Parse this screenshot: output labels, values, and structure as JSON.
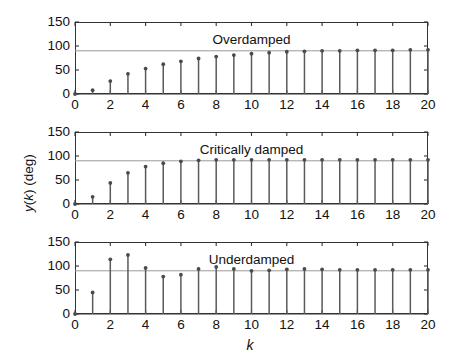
{
  "figure": {
    "width": 462,
    "height": 347,
    "background": "#ffffff",
    "axis_color": "#333333",
    "stem_color": "#5a5a5a",
    "marker_color": "#4a4a4a",
    "reference_line_color": "#999999",
    "xlabel": "k",
    "ylabel_part1": "y",
    "ylabel_part2": "(k) (deg)",
    "ylabel_full": "y(k) (deg)"
  },
  "chart_data": [
    {
      "type": "bar",
      "style": "stem",
      "title": "Overdamped",
      "annotation": "Overdamped",
      "xlabel": "",
      "ylabel": "y(k) (deg)",
      "xlim": [
        0,
        20
      ],
      "ylim": [
        0,
        150
      ],
      "xticks": [
        0,
        2,
        4,
        6,
        8,
        10,
        12,
        14,
        16,
        18,
        20
      ],
      "xticklabels": [
        "0",
        "2",
        "4",
        "6",
        "8",
        "10",
        "12",
        "14",
        "16",
        "18",
        "20"
      ],
      "yticks": [
        0,
        50,
        100,
        150
      ],
      "yticklabels": [
        "0",
        "50",
        "100",
        "150"
      ],
      "grid": false,
      "reference_line": 90,
      "categories": [
        0,
        1,
        2,
        3,
        4,
        5,
        6,
        7,
        8,
        9,
        10,
        11,
        12,
        13,
        14,
        15,
        16,
        17,
        18,
        19,
        20
      ],
      "values": [
        0,
        8,
        27,
        42,
        53,
        62,
        68,
        74,
        78,
        81,
        84,
        86,
        88,
        89,
        90,
        90,
        91,
        91,
        91,
        92,
        92
      ]
    },
    {
      "type": "bar",
      "style": "stem",
      "title": "Critically damped",
      "annotation": "Critically damped",
      "xlabel": "",
      "ylabel": "y(k) (deg)",
      "xlim": [
        0,
        20
      ],
      "ylim": [
        0,
        150
      ],
      "xticks": [
        0,
        2,
        4,
        6,
        8,
        10,
        12,
        14,
        16,
        18,
        20
      ],
      "xticklabels": [
        "0",
        "2",
        "4",
        "6",
        "8",
        "10",
        "12",
        "14",
        "16",
        "18",
        "20"
      ],
      "yticks": [
        0,
        50,
        100,
        150
      ],
      "yticklabels": [
        "0",
        "50",
        "100",
        "150"
      ],
      "grid": false,
      "reference_line": 90,
      "categories": [
        0,
        1,
        2,
        3,
        4,
        5,
        6,
        7,
        8,
        9,
        10,
        11,
        12,
        13,
        14,
        15,
        16,
        17,
        18,
        19,
        20
      ],
      "values": [
        0,
        15,
        44,
        65,
        78,
        85,
        89,
        91,
        92,
        92,
        92,
        92,
        92,
        92,
        92,
        92,
        92,
        92,
        92,
        92,
        92
      ]
    },
    {
      "type": "bar",
      "style": "stem",
      "title": "Underdamped",
      "annotation": "Underdamped",
      "xlabel": "k",
      "ylabel": "y(k) (deg)",
      "xlim": [
        0,
        20
      ],
      "ylim": [
        0,
        150
      ],
      "xticks": [
        0,
        2,
        4,
        6,
        8,
        10,
        12,
        14,
        16,
        18,
        20
      ],
      "xticklabels": [
        "0",
        "2",
        "4",
        "6",
        "8",
        "10",
        "12",
        "14",
        "16",
        "18",
        "20"
      ],
      "yticks": [
        0,
        50,
        100,
        150
      ],
      "yticklabels": [
        "0",
        "50",
        "100",
        "150"
      ],
      "grid": false,
      "reference_line": 90,
      "categories": [
        0,
        1,
        2,
        3,
        4,
        5,
        6,
        7,
        8,
        9,
        10,
        11,
        12,
        13,
        14,
        15,
        16,
        17,
        18,
        19,
        20
      ],
      "values": [
        0,
        45,
        114,
        123,
        96,
        78,
        82,
        94,
        98,
        94,
        90,
        91,
        93,
        94,
        93,
        92,
        92,
        92,
        92,
        92,
        92
      ]
    }
  ]
}
